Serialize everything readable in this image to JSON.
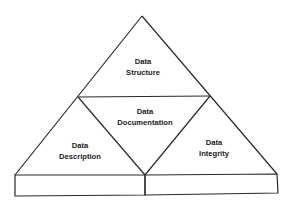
{
  "diagram": {
    "type": "pyramid",
    "sections": {
      "top": {
        "line1": "Data",
        "line2": "Structure"
      },
      "center": {
        "line1": "Data",
        "line2": "Documentation"
      },
      "left": {
        "line1": "Data",
        "line2": "Description"
      },
      "right": {
        "line1": "Data",
        "line2": "Integrity"
      }
    },
    "base": {
      "left_box_label": "",
      "right_box_label": ""
    },
    "colors": {
      "line": "#2a2a2a",
      "text": "#222222",
      "background": "#ffffff"
    }
  }
}
